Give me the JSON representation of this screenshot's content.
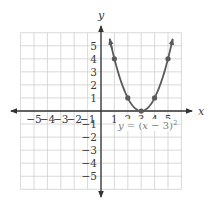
{
  "chart_data": {
    "type": "line",
    "title": "",
    "xlabel": "x",
    "ylabel": "y",
    "xlim": [
      -6,
      6
    ],
    "ylim": [
      -6,
      6
    ],
    "grid": true,
    "x_ticks": [
      -5,
      -4,
      -3,
      -2,
      -1,
      1,
      2,
      3,
      4,
      5
    ],
    "y_ticks": [
      5,
      4,
      3,
      2,
      1,
      -1,
      -2,
      -3,
      -4,
      -5
    ],
    "x_tick_labels": [
      "−5",
      "−4",
      "−3",
      "−2",
      "−1",
      "1",
      "2",
      "3",
      "4",
      "5"
    ],
    "y_tick_labels": [
      "5",
      "4",
      "3",
      "2",
      "1",
      "−1",
      "−2",
      "−3",
      "−4",
      "−5"
    ],
    "series": [
      {
        "name": "y = (x − 3)²",
        "function": "(x-3)^2",
        "domain": [
          0.65,
          5.35
        ],
        "arrows": "both-ends",
        "points": [
          {
            "x": 1,
            "y": 4
          },
          {
            "x": 2,
            "y": 1
          },
          {
            "x": 3,
            "y": 0
          },
          {
            "x": 4,
            "y": 1
          },
          {
            "x": 5,
            "y": 4
          }
        ]
      }
    ],
    "annotations": [
      {
        "text": "y = (x − 3)²",
        "x": 3.3,
        "y": -1.4
      }
    ],
    "colors": {
      "curve": "#5a5a5a",
      "axis": "#333333",
      "grid": "#cfcfcf",
      "equation": "#7a7a7a"
    }
  },
  "labels": {
    "x_axis": "x",
    "y_axis": "y",
    "equation_prefix": "y = (x − 3)",
    "equation_exponent": "2"
  }
}
